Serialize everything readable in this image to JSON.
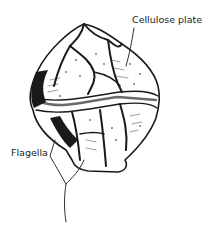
{
  "diagram": {
    "labels": [
      {
        "id": "cellulose",
        "text": "Cellulose plate"
      },
      {
        "id": "flagella",
        "text": "Flagella"
      }
    ],
    "colors": {
      "ink": "#1a1a1a",
      "background": "#ffffff"
    }
  }
}
